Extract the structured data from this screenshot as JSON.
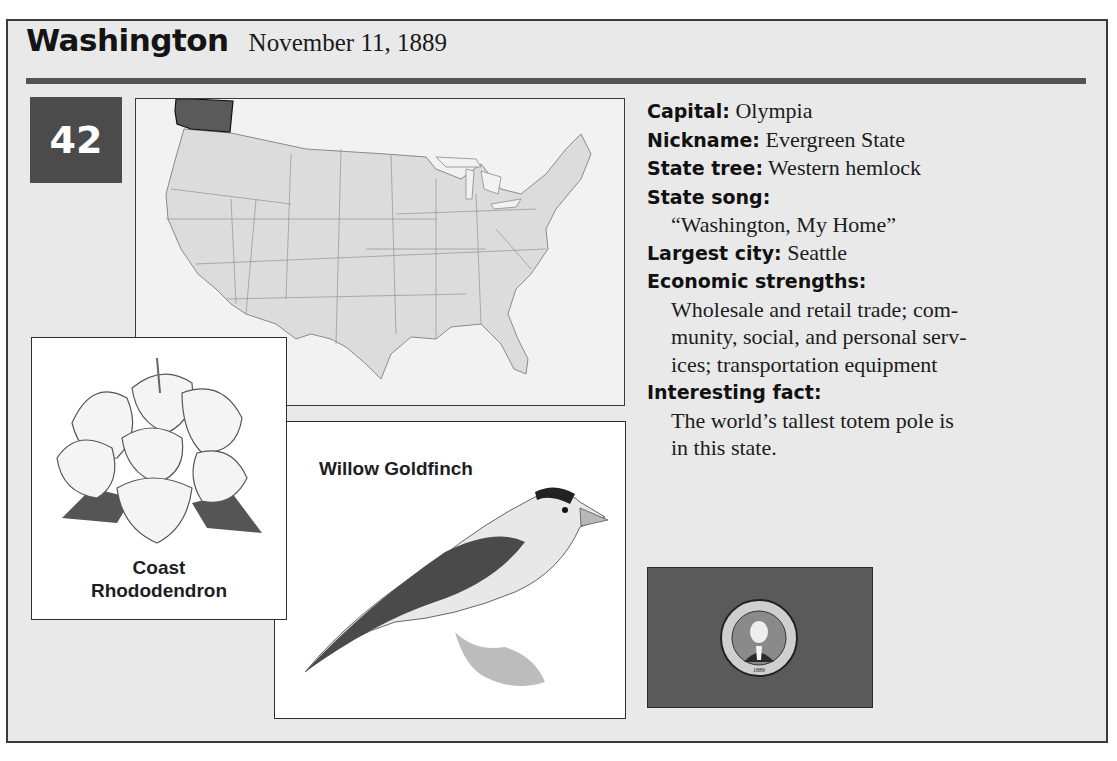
{
  "header": {
    "state_name": "Washington",
    "admission_date": "November 11, 1889",
    "statehood_order": "42"
  },
  "map": {
    "highlighted_state": "Washington",
    "highlight_color": "#5a5a5a",
    "base_color": "#dcdcdc"
  },
  "state_flower": {
    "label_line1": "Coast",
    "label_line2": "Rhododendron"
  },
  "state_bird": {
    "label": "Willow Goldfinch"
  },
  "facts": [
    {
      "key": "Capital:",
      "value": "Olympia"
    },
    {
      "key": "Nickname:",
      "value": "Evergreen State"
    },
    {
      "key": "State tree:",
      "value": "Western hemlock"
    },
    {
      "key": "State song:",
      "value": ""
    },
    {
      "key": "",
      "value": "“Washington, My Home”"
    },
    {
      "key": "Largest city:",
      "value": "Seattle"
    },
    {
      "key": "Economic strengths:",
      "value": ""
    },
    {
      "key": "",
      "value": "Wholesale and retail trade; com-"
    },
    {
      "key": "",
      "value": "munity, social, and personal serv-"
    },
    {
      "key": "",
      "value": "ices; transportation equipment"
    },
    {
      "key": "Interesting fact:",
      "value": ""
    },
    {
      "key": "",
      "value": "The world’s tallest totem pole is"
    },
    {
      "key": "",
      "value": "in this state."
    }
  ],
  "flag": {
    "seal_text": "THE SEAL OF THE STATE OF WASHINGTON",
    "seal_year": "1889",
    "field_color": "#5a5a5a"
  }
}
